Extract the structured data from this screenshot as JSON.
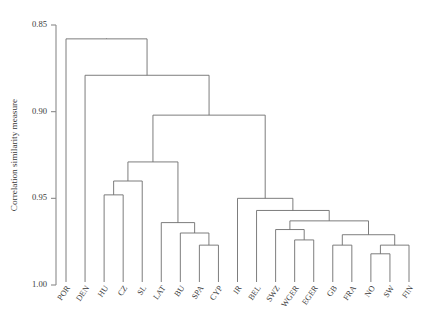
{
  "chart_data": {
    "type": "dendrogram",
    "title": "",
    "xlabel": "",
    "ylabel": "Correlation similarity measure",
    "ylim": [
      0.85,
      1.0
    ],
    "y_inverted": true,
    "yticks": [
      0.85,
      0.9,
      0.95,
      1.0
    ],
    "ytick_labels": [
      "0.85",
      "0.90",
      "0.95",
      "1.00"
    ],
    "grid": false,
    "legend": "none",
    "leaf_order": [
      "POR",
      "DEN",
      "HU",
      "CZ",
      "SL",
      "LAT",
      "BU",
      "SPA",
      "CYP",
      "IR",
      "BEL",
      "SWZ",
      "WGER",
      "EGER",
      "GB",
      "FRA",
      "NO",
      "SW",
      "FIN"
    ],
    "leaves": [
      {
        "label": "POR",
        "pos": 0
      },
      {
        "label": "DEN",
        "pos": 1
      },
      {
        "label": "HU",
        "pos": 2
      },
      {
        "label": "CZ",
        "pos": 3
      },
      {
        "label": "SL",
        "pos": 4
      },
      {
        "label": "LAT",
        "pos": 5
      },
      {
        "label": "BU",
        "pos": 6
      },
      {
        "label": "SPA",
        "pos": 7
      },
      {
        "label": "CYP",
        "pos": 8
      },
      {
        "label": "IR",
        "pos": 9
      },
      {
        "label": "BEL",
        "pos": 10
      },
      {
        "label": "SWZ",
        "pos": 11
      },
      {
        "label": "WGER",
        "pos": 12
      },
      {
        "label": "EGER",
        "pos": 13
      },
      {
        "label": "GB",
        "pos": 14
      },
      {
        "label": "FRA",
        "pos": 15
      },
      {
        "label": "NO",
        "pos": 16
      },
      {
        "label": "SW",
        "pos": 17
      },
      {
        "label": "FIN",
        "pos": 18
      }
    ],
    "merges": [
      {
        "id": "m1",
        "left": "HU",
        "right": "CZ",
        "height": 0.948
      },
      {
        "id": "m2",
        "left": "m1",
        "right": "SL",
        "height": 0.94
      },
      {
        "id": "m3",
        "left": "SPA",
        "right": "CYP",
        "height": 0.977
      },
      {
        "id": "m4",
        "left": "BU",
        "right": "m3",
        "height": 0.97
      },
      {
        "id": "m5",
        "left": "LAT",
        "right": "m4",
        "height": 0.964
      },
      {
        "id": "m6",
        "left": "m2",
        "right": "m5",
        "height": 0.929
      },
      {
        "id": "m7",
        "left": "WGER",
        "right": "EGER",
        "height": 0.974
      },
      {
        "id": "m8",
        "left": "SWZ",
        "right": "m7",
        "height": 0.968
      },
      {
        "id": "m9",
        "left": "GB",
        "right": "FRA",
        "height": 0.977
      },
      {
        "id": "m10",
        "left": "NO",
        "right": "SW",
        "height": 0.982
      },
      {
        "id": "m11",
        "left": "m10",
        "right": "FIN",
        "height": 0.977
      },
      {
        "id": "m12",
        "left": "m9",
        "right": "m11",
        "height": 0.971
      },
      {
        "id": "m13",
        "left": "m8",
        "right": "m12",
        "height": 0.963
      },
      {
        "id": "m14",
        "left": "BEL",
        "right": "m13",
        "height": 0.957
      },
      {
        "id": "m15",
        "left": "IR",
        "right": "m14",
        "height": 0.95
      },
      {
        "id": "m16",
        "left": "m6",
        "right": "m15",
        "height": 0.902
      },
      {
        "id": "m17",
        "left": "DEN",
        "right": "m16",
        "height": 0.879
      },
      {
        "id": "m18",
        "left": "POR",
        "right": "m17",
        "height": 0.858
      }
    ]
  },
  "axis": {
    "y_label": "Correlation similarity measure"
  },
  "colors": {
    "link": "#6e6e6e",
    "axis": "#8a8a8a",
    "text": "#3a3a3a",
    "background": "#ffffff"
  }
}
